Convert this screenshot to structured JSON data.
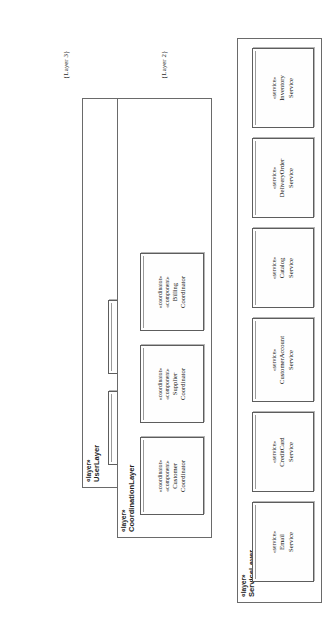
{
  "diagram": {
    "orientation": "rotated-90-ccw",
    "border_color": "#6a6a6a",
    "box_color": "#5d5d5d",
    "background": "#ffffff"
  },
  "layers": [
    {
      "id": "user-layer",
      "stereotype": "«layer»",
      "name": "UserLayer",
      "caption": "{Layer 3}",
      "parts": [
        {
          "stereotypes": [
            "«user interaction»",
            "«component»"
          ],
          "name_line1": "Customer",
          "name_line2": "Interaction"
        },
        {
          "stereotypes": [
            "«user interaction»",
            "«component»"
          ],
          "name_line1": "Supplier",
          "name_line2": "Interaction"
        }
      ]
    },
    {
      "id": "coordination-layer",
      "stereotype": "«layer»",
      "name": "CoordinationLayer",
      "caption": "{Layer 2}",
      "parts": [
        {
          "stereotypes": [
            "«coordinator»",
            "«component»"
          ],
          "name_line1": "Customer",
          "name_line2": "Coordinator"
        },
        {
          "stereotypes": [
            "«coordinator»",
            "«component»"
          ],
          "name_line1": "Supplier",
          "name_line2": "Coordinator"
        },
        {
          "stereotypes": [
            "«coordinator»",
            "«component»"
          ],
          "name_line1": "Billing",
          "name_line2": "Coordinator"
        }
      ]
    },
    {
      "id": "service-layer",
      "stereotype": "«layer»",
      "name": "ServiceLayer",
      "caption": "{Layer 1}",
      "parts": [
        {
          "stereotypes": [
            "«service»"
          ],
          "name_line1": "Email",
          "name_line2": "Service"
        },
        {
          "stereotypes": [
            "«service»"
          ],
          "name_line1": "CreditCard",
          "name_line2": "Service"
        },
        {
          "stereotypes": [
            "«service»"
          ],
          "name_line1": "CustomerAccount",
          "name_line2": "Service"
        },
        {
          "stereotypes": [
            "«service»"
          ],
          "name_line1": "Catalog",
          "name_line2": "Service"
        },
        {
          "stereotypes": [
            "«service»"
          ],
          "name_line1": "DeliveryOrder",
          "name_line2": "Service"
        },
        {
          "stereotypes": [
            "«service»"
          ],
          "name_line1": "Inventory",
          "name_line2": "Service"
        }
      ]
    }
  ]
}
